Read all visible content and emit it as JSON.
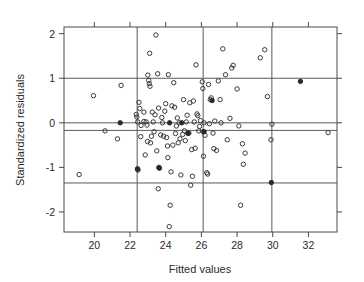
{
  "chart_data": {
    "type": "scatter",
    "title": "",
    "xlabel": "Fitted values",
    "ylabel": "Standardized residuals",
    "xlim": [
      18.3,
      33.6
    ],
    "ylim": [
      -2.45,
      2.15
    ],
    "xticks": [
      20,
      22,
      24,
      26,
      28,
      30,
      32
    ],
    "xtick_labels": [
      "20",
      "22",
      "24",
      "26",
      "28",
      "30",
      "32"
    ],
    "yticks": [
      -2,
      -1,
      0,
      1,
      2
    ],
    "ytick_labels": [
      "-2",
      "-1",
      "0",
      "1",
      "2"
    ],
    "grid": true,
    "gridlines": {
      "horizontal": [
        1.0,
        0.0,
        -0.17,
        -1.35
      ],
      "vertical": [
        22.4,
        26.1,
        29.95
      ]
    },
    "legend": null,
    "marker": "open-circle",
    "point_count": 118,
    "points": [
      [
        19.95,
        0.61
      ],
      [
        19.15,
        -1.16
      ],
      [
        20.6,
        -0.18
      ],
      [
        21.45,
        0.0
      ],
      [
        21.5,
        0.84
      ],
      [
        21.3,
        -0.36
      ],
      [
        22.35,
        0.19
      ],
      [
        22.38,
        0.13
      ],
      [
        22.42,
        -1.03
      ],
      [
        22.45,
        -1.06
      ],
      [
        22.43,
        0.02
      ],
      [
        22.55,
        0.32
      ],
      [
        22.6,
        -0.31
      ],
      [
        22.5,
        0.46
      ],
      [
        22.62,
        -0.06
      ],
      [
        22.78,
        0.03
      ],
      [
        22.85,
        -0.72
      ],
      [
        22.9,
        0.02
      ],
      [
        22.95,
        -0.05
      ],
      [
        22.78,
        0.24
      ],
      [
        22.98,
        -0.42
      ],
      [
        23.0,
        1.07
      ],
      [
        23.05,
        0.95
      ],
      [
        23.08,
        0.88
      ],
      [
        23.12,
        0.82
      ],
      [
        23.1,
        1.56
      ],
      [
        23.15,
        -0.45
      ],
      [
        23.2,
        -0.3
      ],
      [
        23.25,
        0.24
      ],
      [
        23.3,
        0.02
      ],
      [
        23.35,
        -0.2
      ],
      [
        23.4,
        0.18
      ],
      [
        23.45,
        1.97
      ],
      [
        23.5,
        -0.63
      ],
      [
        23.55,
        1.1
      ],
      [
        23.6,
        0.33
      ],
      [
        23.62,
        -1.0
      ],
      [
        23.65,
        -1.02
      ],
      [
        23.58,
        -1.48
      ],
      [
        23.72,
        -0.27
      ],
      [
        23.78,
        0.12
      ],
      [
        23.82,
        0.0
      ],
      [
        23.88,
        -0.3
      ],
      [
        23.95,
        0.26
      ],
      [
        24.0,
        0.43
      ],
      [
        24.05,
        -0.33
      ],
      [
        24.1,
        -0.52
      ],
      [
        24.12,
        -0.78
      ],
      [
        24.15,
        1.08
      ],
      [
        24.2,
        -2.33
      ],
      [
        24.25,
        -1.85
      ],
      [
        24.3,
        -1.1
      ],
      [
        24.35,
        0.38
      ],
      [
        24.4,
        -0.5
      ],
      [
        24.45,
        0.9
      ],
      [
        24.5,
        0.35
      ],
      [
        24.55,
        -0.24
      ],
      [
        24.6,
        -0.07
      ],
      [
        24.65,
        0.11
      ],
      [
        24.7,
        -0.45
      ],
      [
        24.75,
        0.0
      ],
      [
        24.8,
        -0.36
      ],
      [
        24.85,
        -1.17
      ],
      [
        24.9,
        0.0
      ],
      [
        24.95,
        -0.26
      ],
      [
        25.0,
        0.52
      ],
      [
        25.05,
        -0.18
      ],
      [
        25.1,
        -0.4
      ],
      [
        25.15,
        0.02
      ],
      [
        25.2,
        0.17
      ],
      [
        25.25,
        -0.24
      ],
      [
        25.3,
        -0.23
      ],
      [
        25.35,
        0.45
      ],
      [
        25.4,
        -1.4
      ],
      [
        25.45,
        -0.6
      ],
      [
        25.5,
        -1.2
      ],
      [
        25.55,
        0.49
      ],
      [
        25.6,
        0.02
      ],
      [
        25.65,
        -0.57
      ],
      [
        25.7,
        1.3
      ],
      [
        25.75,
        0.2
      ],
      [
        25.8,
        0.16
      ],
      [
        25.85,
        -0.18
      ],
      [
        25.9,
        -0.08
      ],
      [
        25.95,
        0.05
      ],
      [
        26.05,
        0.92
      ],
      [
        26.08,
        0.77
      ],
      [
        26.1,
        -0.2
      ],
      [
        26.12,
        -0.75
      ],
      [
        26.15,
        0.0
      ],
      [
        26.2,
        -0.28
      ],
      [
        26.3,
        -1.12
      ],
      [
        26.35,
        -1.15
      ],
      [
        26.4,
        0.86
      ],
      [
        26.45,
        -0.02
      ],
      [
        26.5,
        0.52
      ],
      [
        26.55,
        0.56
      ],
      [
        26.6,
        0.5
      ],
      [
        26.65,
        -0.23
      ],
      [
        26.7,
        -0.58
      ],
      [
        26.75,
        0.04
      ],
      [
        26.85,
        -0.62
      ],
      [
        26.95,
        0.94
      ],
      [
        27.05,
        0.52
      ],
      [
        27.1,
        0.0
      ],
      [
        27.2,
        1.66
      ],
      [
        27.35,
        1.08
      ],
      [
        27.45,
        -0.38
      ],
      [
        27.6,
        0.1
      ],
      [
        27.7,
        1.23
      ],
      [
        27.78,
        1.29
      ],
      [
        28.0,
        0.76
      ],
      [
        28.1,
        -0.07
      ],
      [
        28.2,
        -1.85
      ],
      [
        28.3,
        -0.47
      ],
      [
        28.35,
        -0.93
      ],
      [
        28.45,
        -0.68
      ],
      [
        29.3,
        1.46
      ],
      [
        29.55,
        1.64
      ],
      [
        29.7,
        0.59
      ],
      [
        29.9,
        -0.38
      ],
      [
        29.95,
        -0.03
      ],
      [
        29.92,
        -1.34
      ],
      [
        31.55,
        0.93
      ],
      [
        33.1,
        -0.22
      ]
    ],
    "dark_points": [
      [
        21.45,
        0.0
      ],
      [
        22.42,
        -1.04
      ],
      [
        23.63,
        -1.01
      ],
      [
        24.22,
        -0.0
      ],
      [
        25.25,
        -0.23
      ],
      [
        26.15,
        -0.2
      ],
      [
        29.92,
        -1.34
      ],
      [
        31.55,
        0.93
      ],
      [
        26.6,
        0.5
      ],
      [
        24.9,
        0.0
      ]
    ]
  }
}
